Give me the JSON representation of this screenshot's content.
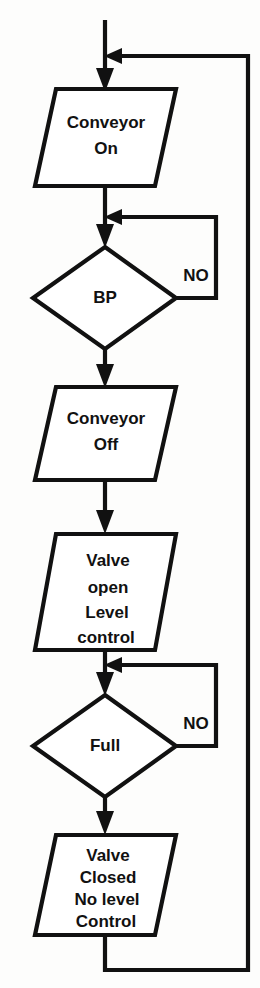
{
  "diagram": {
    "type": "flowchart",
    "colors": {
      "stroke": "#111111",
      "fill": "#ffffff",
      "background": "#fdfdfc"
    },
    "nodes": [
      {
        "id": "conveyor-on",
        "shape": "parallelogram",
        "lines": [
          "Conveyor",
          "On"
        ],
        "line1": "Conveyor",
        "line2": "On"
      },
      {
        "id": "bp-decision",
        "shape": "diamond",
        "lines": [
          "BP"
        ],
        "line1": "BP",
        "branch_label": "NO"
      },
      {
        "id": "conveyor-off",
        "shape": "parallelogram",
        "lines": [
          "Conveyor",
          "Off"
        ],
        "line1": "Conveyor",
        "line2": "Off"
      },
      {
        "id": "valve-open",
        "shape": "parallelogram",
        "lines": [
          "Valve",
          "open",
          "Level",
          "control"
        ],
        "line1": "Valve",
        "line2": "open",
        "line3": "Level",
        "line4": "control"
      },
      {
        "id": "full-decision",
        "shape": "diamond",
        "lines": [
          "Full"
        ],
        "line1": "Full",
        "branch_label": "NO"
      },
      {
        "id": "valve-closed",
        "shape": "parallelogram",
        "lines": [
          "Valve",
          "Closed",
          "No level",
          "Control"
        ],
        "line1": "Valve",
        "line2": "Closed",
        "line3": "No level",
        "line4": "Control"
      }
    ],
    "branch_labels": {
      "bp_no": "NO",
      "full_no": "NO"
    }
  }
}
